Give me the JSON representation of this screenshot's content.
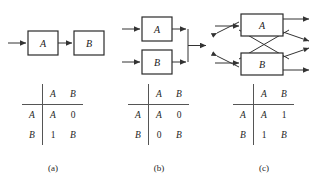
{
  "figure": {
    "panels": [
      {
        "id": "a",
        "caption": "(a)",
        "diagram": {
          "type": "series",
          "blocks": [
            {
              "label": "A"
            },
            {
              "label": "B"
            }
          ]
        },
        "table": {
          "corner": "",
          "col_headers": [
            "A",
            "B"
          ],
          "row_headers": [
            "A",
            "B"
          ],
          "cells": [
            [
              "A",
              "0"
            ],
            [
              "1",
              "B"
            ]
          ]
        }
      },
      {
        "id": "b",
        "caption": "(b)",
        "diagram": {
          "type": "parallel",
          "blocks": [
            {
              "label": "A"
            },
            {
              "label": "B"
            }
          ]
        },
        "table": {
          "corner": "",
          "col_headers": [
            "A",
            "B"
          ],
          "row_headers": [
            "A",
            "B"
          ],
          "cells": [
            [
              "A",
              "0"
            ],
            [
              "0",
              "B"
            ]
          ]
        }
      },
      {
        "id": "c",
        "caption": "(c)",
        "diagram": {
          "type": "crossover",
          "blocks": [
            {
              "label": "A"
            },
            {
              "label": "B"
            }
          ]
        },
        "table": {
          "corner": "",
          "col_headers": [
            "A",
            "B"
          ],
          "row_headers": [
            "A",
            "B"
          ],
          "cells": [
            [
              "A",
              "1"
            ],
            [
              "1",
              "B"
            ]
          ]
        }
      }
    ]
  },
  "colors": {
    "background": "#ffffff",
    "stroke": "#333333",
    "box_stroke": "#2a2a2a",
    "text": "#1a1a1a",
    "rule": "#555555"
  }
}
